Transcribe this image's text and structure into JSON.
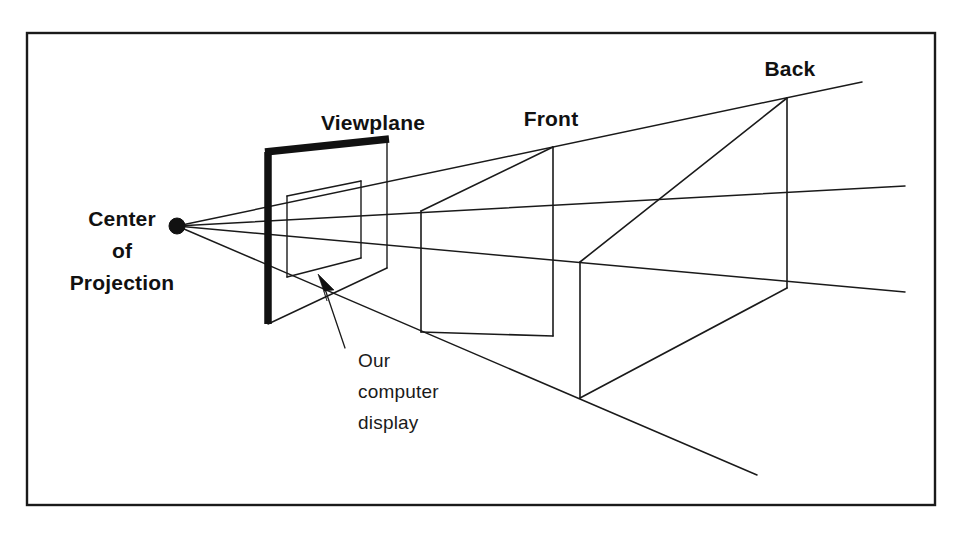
{
  "figure": {
    "background_color": "#ffffff",
    "ink_color": "#111111",
    "frame": {
      "name": "figure-border",
      "x": 27,
      "y": 33,
      "width": 908,
      "height": 472,
      "stroke": "#1a1a1a"
    }
  },
  "labels": {
    "center_of_projection": {
      "line1": "Center",
      "line2": "of",
      "line3": "Projection",
      "weight": "bold",
      "x": 122,
      "y1": 226,
      "y2": 258,
      "y3": 290
    },
    "viewplane": {
      "text": "Viewplane",
      "weight": "bold",
      "x": 373,
      "y": 130
    },
    "front": {
      "text": "Front",
      "weight": "bold",
      "x": 551,
      "y": 126
    },
    "back": {
      "text": "Back",
      "weight": "bold",
      "x": 790,
      "y": 76
    },
    "our_computer_display": {
      "line1": "Our",
      "line2": "computer",
      "line3": "display",
      "weight": "normal",
      "x": 358,
      "y1": 367,
      "y2": 398,
      "y3": 429
    }
  },
  "geometry": {
    "center_of_projection_point": {
      "cx": 177,
      "cy": 226,
      "r": 8
    },
    "rays": [
      {
        "name": "ray-top",
        "x1": 177,
        "y1": 226,
        "x2": 862,
        "y2": 82
      },
      {
        "name": "ray-upper-mid",
        "x1": 177,
        "y1": 226,
        "x2": 905,
        "y2": 186
      },
      {
        "name": "ray-lower-mid",
        "x1": 177,
        "y1": 226,
        "x2": 905,
        "y2": 292
      },
      {
        "name": "ray-bottom",
        "x1": 177,
        "y1": 226,
        "x2": 757,
        "y2": 475
      }
    ],
    "viewplane_thick_edge": "M 268,152 L 268,324",
    "viewplane_thick_top": "M 268,152 L 387,140",
    "viewplane_quad": [
      {
        "x": 268,
        "y": 152
      },
      {
        "x": 387,
        "y": 140
      },
      {
        "x": 387,
        "y": 268
      },
      {
        "x": 268,
        "y": 324
      }
    ],
    "display_rect": [
      {
        "x": 287,
        "y": 196
      },
      {
        "x": 361,
        "y": 181
      },
      {
        "x": 361,
        "y": 258
      },
      {
        "x": 287,
        "y": 277
      }
    ],
    "front_plane_quad": [
      {
        "x": 421,
        "y": 211
      },
      {
        "x": 553,
        "y": 147
      },
      {
        "x": 553,
        "y": 336
      },
      {
        "x": 421,
        "y": 332
      }
    ],
    "back_plane_quad": [
      {
        "x": 580,
        "y": 262
      },
      {
        "x": 787,
        "y": 98
      },
      {
        "x": 787,
        "y": 288
      },
      {
        "x": 580,
        "y": 398
      }
    ],
    "leader_line": {
      "x1": 343,
      "y1": 345,
      "x2": 323,
      "y2": 283
    },
    "arrow_tip": {
      "x": 320,
      "y": 277
    }
  },
  "icons": {
    "cop_dot": "filled-circle-icon",
    "callout_arrow": "arrow-pointer-icon"
  }
}
